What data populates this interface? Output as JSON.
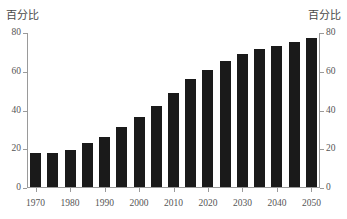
{
  "axis_captions": {
    "left": "百分比",
    "right": "百分比"
  },
  "chart_data": {
    "type": "bar",
    "title": "",
    "xlabel": "",
    "ylabel": "百分比",
    "y2label": "百分比",
    "ylim": [
      0,
      80
    ],
    "yticks": [
      0,
      20,
      40,
      60,
      80
    ],
    "ytick_labels": [
      "0",
      "20",
      "40",
      "60",
      "80"
    ],
    "y2ticks": [
      0,
      20,
      40,
      60,
      80
    ],
    "y2tick_labels": [
      "0",
      "20",
      "40",
      "60",
      "80"
    ],
    "grid": false,
    "legend": null,
    "bar_color": "#1a1a1a",
    "axis_color": "#9a9a9a",
    "text_color": "#555555",
    "categories": [
      "1970",
      "1975",
      "1980",
      "1985",
      "1990",
      "1995",
      "2000",
      "2005",
      "2010",
      "2015",
      "2020",
      "2025",
      "2030",
      "2035",
      "2040",
      "2045",
      "2050"
    ],
    "values": [
      17.5,
      17.5,
      19.0,
      22.5,
      26.0,
      31.0,
      36.0,
      42.0,
      48.5,
      55.5,
      60.5,
      65.0,
      68.5,
      71.0,
      73.0,
      75.0,
      77.0
    ],
    "xtick_labels": [
      "1970",
      "1980",
      "1990",
      "2000",
      "2010",
      "2020",
      "2030",
      "2040",
      "2050"
    ],
    "xtick_categories": [
      "1970",
      "1980",
      "1990",
      "2000",
      "2010",
      "2020",
      "2030",
      "2040",
      "2050"
    ]
  }
}
